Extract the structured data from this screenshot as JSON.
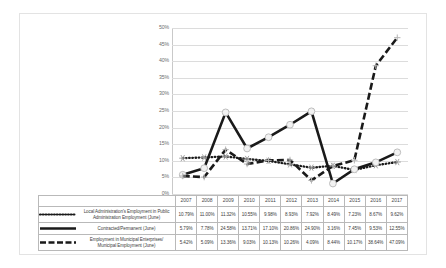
{
  "chart_data": {
    "type": "line",
    "title": "",
    "xlabel": "",
    "ylabel": "",
    "categories": [
      "2007",
      "2008",
      "2009",
      "2010",
      "2011",
      "2012",
      "2013",
      "2014",
      "2015",
      "2016",
      "2017"
    ],
    "ylim": [
      0,
      50
    ],
    "ytick_labels": [
      "0%",
      "5%",
      "10%",
      "15%",
      "20%",
      "25%",
      "30%",
      "35%",
      "40%",
      "45%",
      "50%"
    ],
    "ytick_values": [
      0,
      5,
      10,
      15,
      20,
      25,
      30,
      35,
      40,
      45,
      50
    ],
    "grid": true,
    "legend_position": "data-table-left",
    "series": [
      {
        "name": "Local Administration's Employment in Public Administration Employment (June)",
        "style": "dotted",
        "color": "#1a1a1a",
        "marker": "star",
        "values": [
          10.79,
          11.0,
          11.32,
          10.55,
          9.98,
          8.93,
          7.92,
          8.49,
          7.23,
          8.67,
          9.62
        ],
        "labels": [
          "10.79%",
          "11.00%",
          "11.32%",
          "10.55%",
          "9.98%",
          "8.93%",
          "7.92%",
          "8.49%",
          "7.23%",
          "8.67%",
          "9.62%"
        ]
      },
      {
        "name": "Contracted/Permanent (June)",
        "style": "solid",
        "color": "#1a1a1a",
        "marker": "circle",
        "values": [
          5.79,
          7.78,
          24.58,
          13.71,
          17.1,
          20.86,
          24.9,
          3.16,
          7.45,
          9.53,
          12.55
        ],
        "labels": [
          "5.79%",
          "7.78%",
          "24.58%",
          "13.71%",
          "17.10%",
          "20.86%",
          "24.90%",
          "3.16%",
          "7.45%",
          "9.53%",
          "12.55%"
        ]
      },
      {
        "name": "Employment in Municipal Enterprises/ Municipal Employment (June)",
        "style": "dashed",
        "color": "#1a1a1a",
        "marker": "plus",
        "values": [
          5.42,
          5.09,
          13.36,
          9.03,
          10.13,
          10.26,
          4.09,
          8.44,
          10.17,
          38.64,
          47.09
        ],
        "labels": [
          "5.42%",
          "5.09%",
          "13.36%",
          "9.03%",
          "10.13%",
          "10.26%",
          "4.09%",
          "8.44%",
          "10.17%",
          "38.64%",
          "47.09%"
        ]
      }
    ]
  },
  "table": {
    "legend_labels": [
      "Local Administration's Employment in Public Administration Employment (June)",
      "Contracted/Permanent (June)",
      "Employment in Municipal Enterprises/ Municipal Employment (June)"
    ]
  }
}
